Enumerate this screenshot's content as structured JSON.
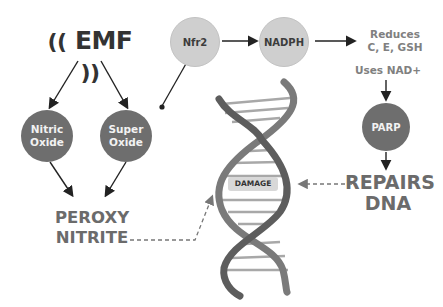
{
  "emf": {
    "label": "EMF",
    "left_wave": "((",
    "right_wave": "))"
  },
  "nodes": {
    "nitric_oxide": "Nitric\nOxide",
    "super_oxide": "Super\nOxide",
    "nfr2": "Nfr2",
    "nadph": "NADPH",
    "parp": "PARP"
  },
  "labels": {
    "peroxy": "PEROXY",
    "nitrite": "NITRITE",
    "reduces_1": "Reduces",
    "reduces_2": "C, E, GSH",
    "uses_nad": "Uses NAD+",
    "repairs": "REPAIRS",
    "dna": "DNA",
    "damage": "DAMAGE"
  },
  "colors": {
    "dark_node": "#6e6e6e",
    "light_node": "#cfcfcf",
    "text_gray": "#707070",
    "arrow": "#222222"
  }
}
